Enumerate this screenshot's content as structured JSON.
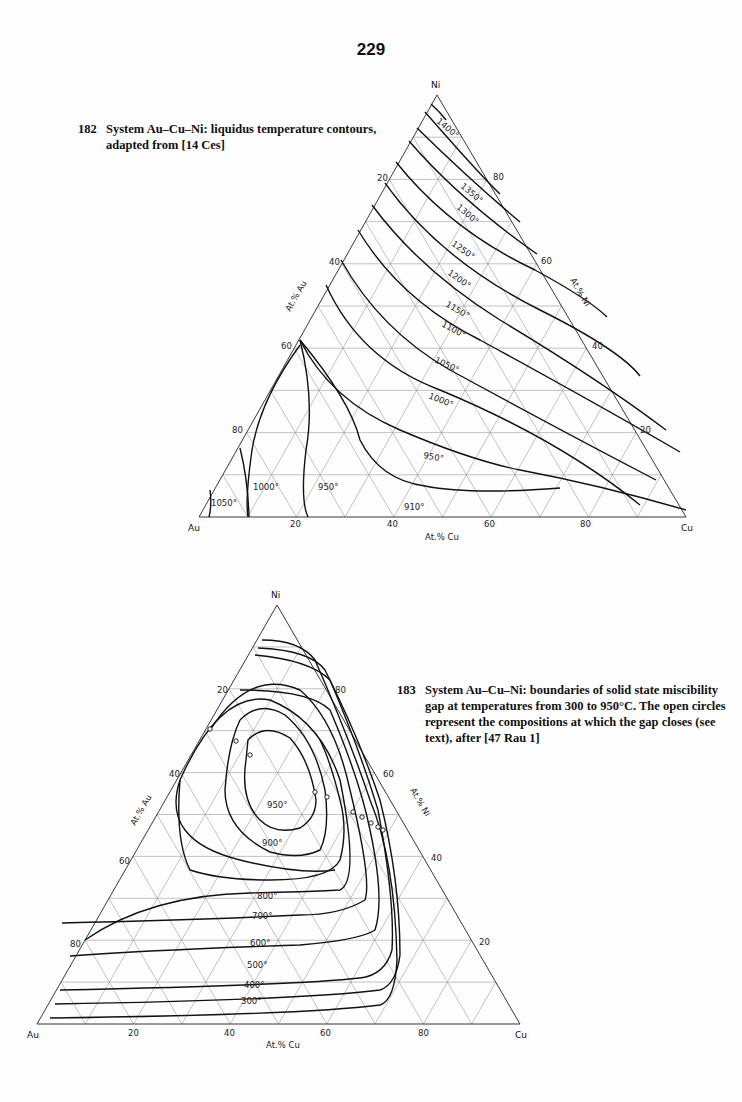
{
  "page": {
    "number": "229"
  },
  "figures": [
    {
      "number": "182",
      "caption": "System Au–Cu–Ni: liquidus temperature contours, adapted from [14 Ces]"
    },
    {
      "number": "183",
      "caption": "System Au–Cu–Ni: boundaries of solid state miscibility gap at temperatures from 300 to 950°C. The open circles represent the compositions at which the gap closes (see text), after [47 Rau 1]"
    }
  ],
  "chart_data": [
    {
      "type": "ternary-contour",
      "title": "System Au–Cu–Ni: liquidus temperature contours",
      "vertices": {
        "top": "Ni",
        "left": "Au",
        "right": "Cu"
      },
      "axis_labels": {
        "left": "At.% Au",
        "right": "At.% Ni",
        "bottom": "At.% Cu"
      },
      "ticks": {
        "left": [
          "20",
          "40",
          "60",
          "80"
        ],
        "right": [
          "80",
          "60",
          "40",
          "20"
        ],
        "bottom": [
          "20",
          "40",
          "60",
          "80"
        ]
      },
      "grid_step": 10,
      "isotherms": [
        "1400°",
        "1350°",
        "1300°",
        "1250°",
        "1200°",
        "1150°",
        "1100°",
        "1050°",
        "1000°",
        "950°",
        "910°",
        "1000°",
        "950°",
        "1050°"
      ],
      "isotherm_labels": [
        {
          "t": "1400°"
        },
        {
          "t": "1350°"
        },
        {
          "t": "1300°"
        },
        {
          "t": "1250°"
        },
        {
          "t": "1200°"
        },
        {
          "t": "1150°"
        },
        {
          "t": "1100°"
        },
        {
          "t": "1050°"
        },
        {
          "t": "1000°"
        },
        {
          "t": "950°"
        },
        {
          "t": "910°"
        },
        {
          "t": "1050°"
        },
        {
          "t": "1000°"
        },
        {
          "t": "950°"
        }
      ]
    },
    {
      "type": "ternary-contour",
      "title": "System Au–Cu–Ni: boundaries of solid state miscibility gap",
      "vertices": {
        "top": "Ni",
        "left": "Au",
        "right": "Cu"
      },
      "axis_labels": {
        "left": "At.% Au",
        "right": "At.% Ni",
        "bottom": "At.% Cu"
      },
      "ticks": {
        "left": [
          "20",
          "40",
          "60",
          "80"
        ],
        "right": [
          "80",
          "60",
          "40",
          "20"
        ],
        "bottom": [
          "20",
          "40",
          "60",
          "80"
        ]
      },
      "grid_step": 10,
      "isotherms": [
        "950°",
        "900°",
        "800°",
        "700°",
        "600°",
        "500°",
        "400°",
        "300°"
      ],
      "critical_points_note": "open circles mark compositions where gap closes"
    }
  ],
  "labels": {
    "ni": "Ni",
    "au": "Au",
    "cu": "Cu",
    "at_au": "At.% Au",
    "at_ni": "At.% Ni",
    "at_cu": "At.% Cu",
    "t20": "20",
    "t40": "40",
    "t60": "60",
    "t80": "80",
    "c1400": "1400°",
    "c1350": "1350°",
    "c1300": "1300°",
    "c1250": "1250°",
    "c1200": "1200°",
    "c1150": "1150°",
    "c1100": "1100°",
    "c1050": "1050°",
    "c1000": "1000°",
    "c950": "950°",
    "c910": "910°",
    "c900": "900°",
    "c800": "800°",
    "c700": "700°",
    "c600": "600°",
    "c500": "500°",
    "c400": "400°",
    "c300": "300°"
  }
}
